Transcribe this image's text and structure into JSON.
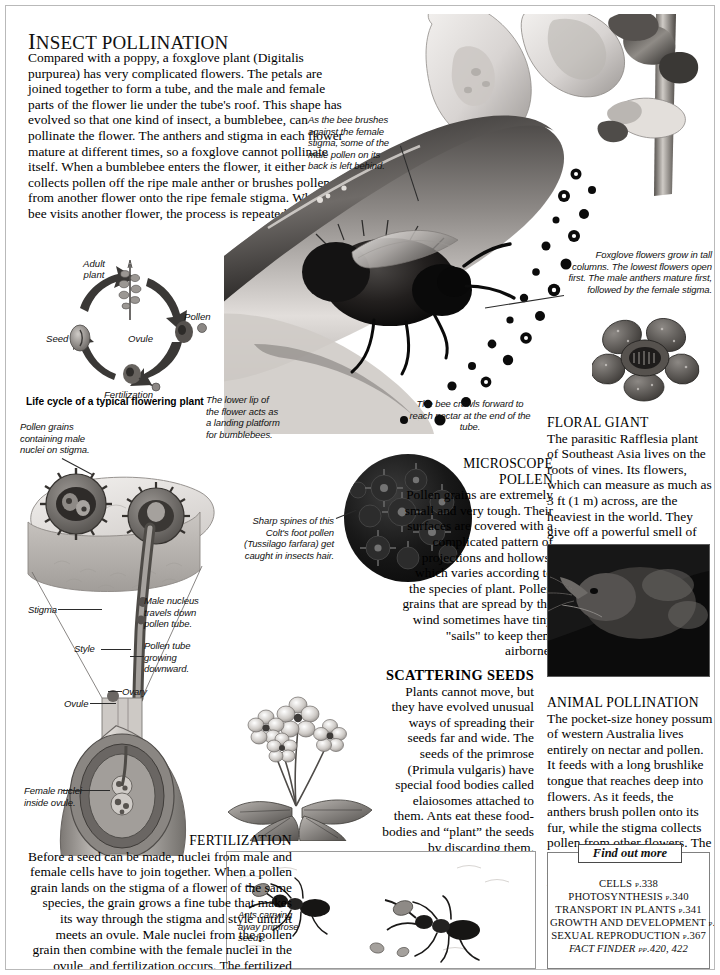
{
  "page": {
    "headline_first_letter": "I",
    "headline_rest": "NSECT POLLINATION",
    "headline_full": "INSECT POLLINATION",
    "intro": "Compared with a poppy, a foxglove plant (Digitalis purpurea) has very complicated flowers. The petals are joined together to form a tube, and the male and female parts of the flower lie under the tube's roof. This shape has evolved so that one kind of insect, a bumblebee, can pollinate the flower. The anthers and stigma in each flower mature at different times, so a foxglove cannot pollinate itself. When a bumblebee enters the flower, it either collects pollen off the ripe male anther or brushes pollen from another flower onto the ripe female stigma. When the bee visits another flower, the process is repeated."
  },
  "lifecycle": {
    "title": "Life cycle of a typical flowering plant",
    "labels": {
      "adult_plant": "Adult\nplant",
      "pollen": "Pollen",
      "ovule": "Ovule",
      "fertilization": "Fertilization",
      "seed": "Seed"
    }
  },
  "captions": {
    "bee_brushes": "As the bee brushes against the female stigma, some of the male pollen on its back is left behind.",
    "foxglove_columns": "Foxglove flowers grow in tall columns. The lowest flowers open first. The male anthers mature first, followed by the female stigma.",
    "lower_lip": "The lower lip of the flower acts as a landing platform for bumblebees.",
    "bee_crawls": "The bee crawls forward to reach nectar at the end of the tube.",
    "pollen_grains_stigma": "Pollen grains containing male nuclei on stigma.",
    "stigma": "Stigma",
    "style": "Style",
    "ovule": "Ovule",
    "ovary": "Ovary",
    "male_nucleus": "Male nucleus travels down pollen tube.",
    "pollen_tube": "Pollen tube growing downward.",
    "female_nuclei": "Female nuclei inside ovule.",
    "coltsfoot": "Sharp spines of this Colt's foot pollen (Tussilago farfara) get caught in insects hair.",
    "ants": "Ants carrying away primrose seeds."
  },
  "sections": {
    "floral_giant": {
      "heading": "FLORAL GIANT",
      "body": "The parasitic Rafflesia plant of Southeast Asia lives on the roots of vines. Its flowers, which can measure as much as 3 ft (1 m) across, are the heaviest in the world. They give off a powerful smell of rotting meat to attract pollinating flies.",
      "italic_term": "Rafflesia"
    },
    "microscope_pollen": {
      "heading_line1": "MICROSCOPE",
      "heading_line2": "POLLEN",
      "body": "Pollen grains are extremely small and very tough. Their surfaces are covered with a complicated pattern of projections and hollows, which varies according to the species of plant. Pollen grains that are spread by the wind sometimes have tiny \"sails\" to keep them airborne."
    },
    "scattering_seeds": {
      "heading": "SCATTERING SEEDS",
      "body": "Plants cannot move, but they have evolved unusual ways of spreading their seeds far and wide. The seeds of the primrose (Primula vulgaris) have special food bodies called elaiosomes attached to them. Ants eat these food-bodies and “plant” the seeds by discarding them.",
      "italic_term": "Primula vulgaris"
    },
    "animal_pollination": {
      "heading": "ANIMAL POLLINATION",
      "body": "The pocket-size honey possum of western Australia lives entirely on nectar and pollen. It feeds with a long brushlike tongue that reaches deep into flowers. As it feeds, the anthers brush pollen onto its fur, while the stigma collects pollen from other flowers. The flowers of many kinds of tropical trees are pollinated by bats."
    },
    "fertilization": {
      "heading": "FERTILIZATION",
      "body": "Before a seed can be made, nuclei from male and female cells have to join together. When a pollen grain lands on the stigma of a flower of the same species, the grain grows a fine tube that makes its way through the stigma and style until it meets an ovule. Male nuclei from the pollen grain then combine with the female nuclei in the ovule, and fertilization occurs. The fertilized ovule then grows into a seed."
    }
  },
  "find_out_more": {
    "title": "Find out more",
    "items": [
      "CELLS p.338",
      "PHOTOSYNTHESIS p.340",
      "TRANSPORT IN PLANTS p.341",
      "GROWTH AND DEVELOPMENT p.362",
      "SEXUAL REPRODUCTION p.367"
    ],
    "fact_finder": "FACT FINDER pp.420, 422"
  },
  "colors": {
    "page_border": "#b9b9b9",
    "text": "#111111",
    "rule": "#2b2b2b"
  }
}
